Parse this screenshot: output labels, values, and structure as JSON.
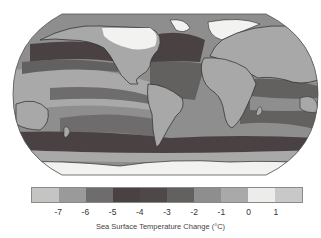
{
  "figure": {
    "type": "choropleth world map",
    "projection": "Robinson",
    "colors": {
      "background": "#ffffff",
      "ice_land": "#f2f2f0",
      "land": "#a8a8a8",
      "coastline": "#2a2a2a",
      "map_border": "#555555"
    }
  },
  "legend": {
    "title": "Sea Surface Temperature Change (°C)",
    "swatches": [
      {
        "range": "< -7",
        "color": "#c4c4c2"
      },
      {
        "range": "-7 to -6",
        "color": "#9a9a9a"
      },
      {
        "range": "-6 to -5",
        "color": "#6e6c6c"
      },
      {
        "range": "-5 to -4",
        "color": "#4a4242"
      },
      {
        "range": "-4 to -3",
        "color": "#4f4848"
      },
      {
        "range": "-3 to -2",
        "color": "#636060"
      },
      {
        "range": "-2 to -1",
        "color": "#8e8e8e"
      },
      {
        "range": "-1 to 0",
        "color": "#a9a9a9"
      },
      {
        "range": "0 to 1",
        "color": "#ececea"
      },
      {
        "range": "> 1",
        "color": "#c8c8c8"
      }
    ],
    "ticks": [
      "-7",
      "-6",
      "-5",
      "-4",
      "-3",
      "-2",
      "-1",
      "0",
      "1"
    ]
  },
  "regions": [
    {
      "name": "North Pacific band",
      "value_class": "-5 to -4"
    },
    {
      "name": "North Atlantic",
      "value_class": "-5 to -4"
    },
    {
      "name": "Southern Ocean band",
      "value_class": "-5 to -4"
    },
    {
      "name": "Tropical Pacific",
      "value_class": "-2 to -1"
    },
    {
      "name": "Equatorial Pacific band",
      "value_class": "-3 to -2"
    },
    {
      "name": "Indian Ocean",
      "value_class": "-3 to -2"
    },
    {
      "name": "Antarctic margin",
      "value_class": "-1 to 0"
    },
    {
      "name": "Ice sheets (Laurentide, Scandinavian, Antarctic)",
      "value_class": "ice"
    }
  ]
}
